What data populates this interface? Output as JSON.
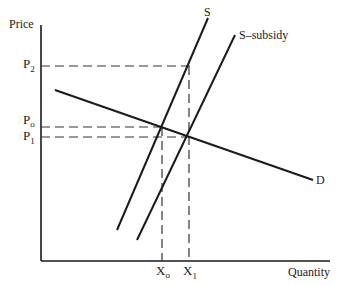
{
  "diagram": {
    "type": "supply-demand",
    "y_axis_label": "Price",
    "x_axis_label": "Quantity",
    "price_labels": {
      "p2": {
        "base": "P",
        "sub": "2"
      },
      "p0": {
        "base": "P",
        "sub": "o"
      },
      "p1": {
        "base": "P",
        "sub": "1"
      }
    },
    "quantity_labels": {
      "x0": {
        "base": "X",
        "sub": "o"
      },
      "x1": {
        "base": "X",
        "sub": "1"
      }
    },
    "curves": {
      "supply": "S",
      "supply_subsidy": "S–subsidy",
      "demand": "D"
    },
    "colors": {
      "line": "#1a1a1a",
      "dashed": "#333333",
      "background": "#ffffff"
    }
  }
}
